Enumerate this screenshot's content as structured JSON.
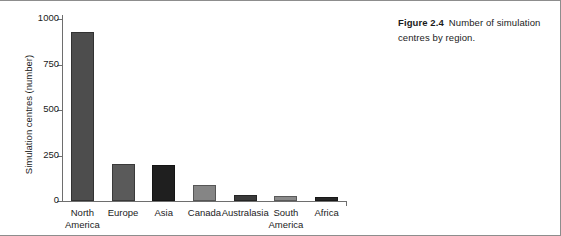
{
  "caption": {
    "figure_label": "Figure 2.4",
    "text": "Number of simulation centres by region."
  },
  "chart_data": {
    "type": "bar",
    "title": "",
    "xlabel": "",
    "ylabel": "Simulation centres (number)",
    "ylim": [
      0,
      1000
    ],
    "ytick_labels": [
      "0",
      "250",
      "500",
      "750",
      "1000"
    ],
    "ytick_values": [
      0,
      250,
      500,
      750,
      1000
    ],
    "grid": false,
    "legend": "none",
    "categories": [
      "North America",
      "Europe",
      "Asia",
      "Canada",
      "Australasia",
      "South America",
      "Africa"
    ],
    "values": [
      930,
      205,
      198,
      88,
      32,
      30,
      20
    ],
    "bar_colors": [
      "#4d4d4d",
      "#5a5a5a",
      "#1f1f1f",
      "#858585",
      "#3a3a3a",
      "#8a8a8a",
      "#262626"
    ]
  }
}
